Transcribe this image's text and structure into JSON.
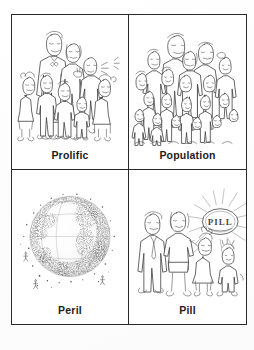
{
  "document": {
    "kind": "vocabulary-flashcard-sheet",
    "layout": "2x2 grid of illustrated word cards",
    "background_color": "#ffffff",
    "ink_color": "#3a3a3a",
    "border_color": "#2a2a2a",
    "caption_color": "#1c1c1c"
  },
  "cards": [
    {
      "id": "prolific",
      "label": "Prolific",
      "position": "top-left",
      "illustration": "large-family-group",
      "illustration_description": "Cartoon line drawing of a tall father in a bow tie, a mother, and many children of assorted heights clustered together"
    },
    {
      "id": "population",
      "label": "Population",
      "position": "top-right",
      "illustration": "dense-crowd-of-people",
      "illustration_description": "Cartoon line drawing of a dense crowd: tall adults at the back and rows of smaller figures filling the frame"
    },
    {
      "id": "peril",
      "label": "Peril",
      "position": "bottom-left",
      "illustration": "stippled-globe",
      "illustration_description": "Earth globe rendered in heavy stippling, dark crowded dots swarming over the continents with faint latitude and longitude lines"
    },
    {
      "id": "pill",
      "label": "Pill",
      "position": "bottom-right",
      "illustration": "small-family-with-radiating-pill",
      "illustration_description": "Cartoon family of four - father, mother, girl with bow, small child - beside a glowing oval labelled PILL emitting rays"
    }
  ],
  "pill_badge": {
    "text": "PILL",
    "shape": "oval with radiating rays"
  }
}
